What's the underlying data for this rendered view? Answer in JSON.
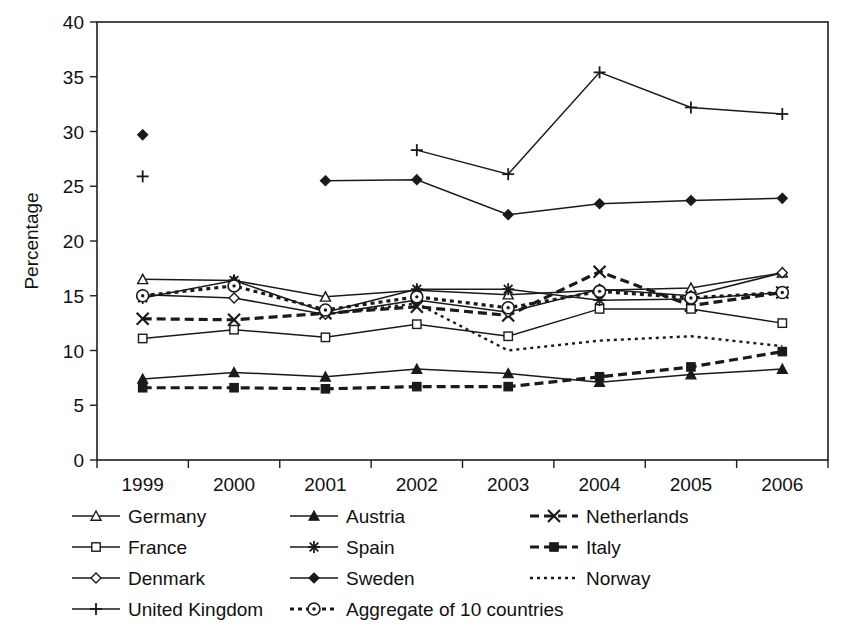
{
  "chart_data": {
    "type": "line",
    "title": "",
    "xlabel": "",
    "ylabel": "Percentage",
    "categories": [
      "1999",
      "2000",
      "2001",
      "2002",
      "2003",
      "2004",
      "2005",
      "2006"
    ],
    "x": [
      1999,
      2000,
      2001,
      2002,
      2003,
      2004,
      2005,
      2006
    ],
    "ylim": [
      0,
      40
    ],
    "ytick_step": 5,
    "yticks": [
      "0",
      "5",
      "10",
      "15",
      "20",
      "25",
      "30",
      "35",
      "40"
    ],
    "grid": false,
    "legend_position": "below-plot",
    "series": [
      {
        "name": "Germany",
        "marker": "triangle-open",
        "line_style": "solid",
        "values": [
          16.5,
          16.4,
          14.9,
          15.5,
          15.1,
          15.5,
          15.7,
          17.1
        ]
      },
      {
        "name": "Austria",
        "marker": "triangle-filled",
        "line_style": "solid",
        "values": [
          7.4,
          8.0,
          7.6,
          8.3,
          7.9,
          7.1,
          7.8,
          8.3
        ]
      },
      {
        "name": "Netherlands",
        "marker": "x-cross",
        "line_style": "dashed",
        "values": [
          12.9,
          12.8,
          13.4,
          14.0,
          13.2,
          17.2,
          14.1,
          15.3
        ]
      },
      {
        "name": "France",
        "marker": "square-open",
        "line_style": "solid",
        "values": [
          11.1,
          11.9,
          11.2,
          12.4,
          11.3,
          13.8,
          13.8,
          12.5
        ]
      },
      {
        "name": "Spain",
        "marker": "asterisk",
        "line_style": "solid",
        "values": [
          14.8,
          16.4,
          13.5,
          15.6,
          15.6,
          14.6,
          14.7,
          15.3
        ]
      },
      {
        "name": "Italy",
        "marker": "square-filled",
        "line_style": "dashed",
        "values": [
          6.6,
          6.6,
          6.5,
          6.7,
          6.7,
          7.6,
          8.5,
          9.9
        ]
      },
      {
        "name": "Denmark",
        "marker": "diamond-open",
        "line_style": "solid",
        "values": [
          15.1,
          14.8,
          13.3,
          14.6,
          13.5,
          15.6,
          15.0,
          17.1
        ]
      },
      {
        "name": "Sweden",
        "marker": "diamond-filled",
        "line_style": "solid",
        "values": [
          29.7,
          null,
          25.5,
          25.6,
          22.4,
          23.4,
          23.7,
          23.9
        ]
      },
      {
        "name": "Norway",
        "marker": "none",
        "line_style": "dotted",
        "values": [
          null,
          null,
          13.3,
          14.3,
          10.0,
          10.9,
          11.3,
          10.4
        ]
      },
      {
        "name": "United Kingdom",
        "marker": "plus",
        "line_style": "solid",
        "values": [
          25.9,
          null,
          null,
          28.3,
          26.1,
          35.4,
          32.2,
          31.6
        ]
      },
      {
        "name": "Aggregate of 10 countries",
        "marker": "circle-dot",
        "line_style": "dotted-thick",
        "values": [
          15.0,
          15.9,
          13.7,
          14.9,
          13.9,
          15.4,
          14.8,
          15.3
        ]
      }
    ]
  },
  "legend": {
    "items": [
      {
        "label": "Germany",
        "marker": "triangle-open",
        "line_style": "solid"
      },
      {
        "label": "Austria",
        "marker": "triangle-filled",
        "line_style": "solid"
      },
      {
        "label": "Netherlands",
        "marker": "x-cross",
        "line_style": "dashed"
      },
      {
        "label": "France",
        "marker": "square-open",
        "line_style": "solid"
      },
      {
        "label": "Spain",
        "marker": "asterisk",
        "line_style": "solid"
      },
      {
        "label": "Italy",
        "marker": "square-filled",
        "line_style": "dashed"
      },
      {
        "label": "Denmark",
        "marker": "diamond-open",
        "line_style": "solid"
      },
      {
        "label": "Sweden",
        "marker": "diamond-filled",
        "line_style": "solid"
      },
      {
        "label": "Norway",
        "marker": "none",
        "line_style": "dotted"
      },
      {
        "label": "United Kingdom",
        "marker": "plus",
        "line_style": "solid"
      },
      {
        "label": "Aggregate of 10 countries",
        "marker": "circle-dot",
        "line_style": "dotted-thick"
      }
    ]
  },
  "colors": {
    "background": "#ffffff",
    "ink": "#1a1a1a",
    "axis": "#1d1d1d"
  }
}
